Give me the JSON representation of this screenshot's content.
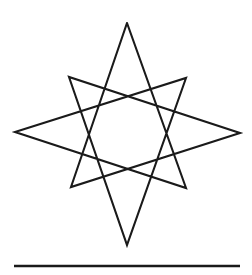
{
  "figure": {
    "stroke_color": "#1a1a1a",
    "background_color": "#ffffff",
    "stroke_width": 2.1,
    "canvas": {
      "width": 252,
      "height": 275
    },
    "vertices": [
      {
        "name": "top-apex",
        "x": 127,
        "y": 23
      },
      {
        "name": "lower-left-point",
        "x": 71,
        "y": 187
      },
      {
        "name": "right-horizontal-end",
        "x": 240,
        "y": 133
      },
      {
        "name": "left-peak",
        "x": 69,
        "y": 77
      },
      {
        "name": "bottom-apex",
        "x": 127,
        "y": 245
      },
      {
        "name": "right-peak",
        "x": 186,
        "y": 78
      },
      {
        "name": "left-horizontal-end",
        "x": 15,
        "y": 132
      },
      {
        "name": "lower-right-point",
        "x": 186,
        "y": 188
      }
    ],
    "path_points": "127,23 71,187 240,133 69,77 127,245 186,78 15,132 186,188 127,23",
    "point_count": 8
  },
  "rule": {
    "name": "horizontal-rule",
    "x1": 14,
    "y1": 266,
    "x2": 240,
    "y2": 266,
    "color": "#1a1a1a"
  }
}
